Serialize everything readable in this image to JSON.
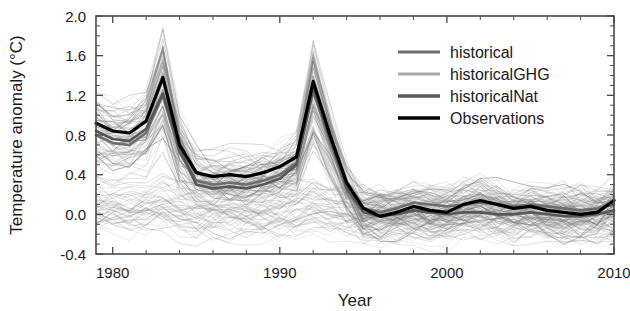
{
  "chart_data": {
    "type": "line",
    "title": "",
    "xlabel": "Year",
    "ylabel": "Temperature anomaly (°C)",
    "xlim": [
      1979,
      2010
    ],
    "ylim": [
      -0.4,
      2.0
    ],
    "xticks": [
      1980,
      1990,
      2000,
      2010
    ],
    "xtick_labels": [
      "1980",
      "1990",
      "2000",
      "2010"
    ],
    "xtick_minor_step": 2,
    "yticks": [
      -0.4,
      0.0,
      0.4,
      0.8,
      1.2,
      1.6,
      2.0
    ],
    "ytick_labels": [
      "-0.4",
      "0.0",
      "0.4",
      "0.8",
      "1.2",
      "1.6",
      "2.0"
    ],
    "ytick_minor_step": 0.1,
    "grid": false,
    "ticks_direction": "in",
    "legend_position": "upper right",
    "x": [
      1979,
      1980,
      1981,
      1982,
      1983,
      1984,
      1985,
      1986,
      1987,
      1988,
      1989,
      1990,
      1991,
      1992,
      1993,
      1994,
      1995,
      1996,
      1997,
      1998,
      1999,
      2000,
      2001,
      2002,
      2003,
      2004,
      2005,
      2006,
      2007,
      2008,
      2009,
      2010
    ],
    "series": [
      {
        "name": "historical",
        "color": "#6e6e6e",
        "linewidth": 2.6,
        "role": "ensemble-mean",
        "values": [
          0.8,
          0.72,
          0.7,
          0.82,
          1.2,
          0.62,
          0.34,
          0.3,
          0.32,
          0.3,
          0.34,
          0.4,
          0.52,
          1.24,
          0.74,
          0.28,
          0.06,
          0.02,
          0.06,
          0.12,
          0.1,
          0.08,
          0.1,
          0.12,
          0.1,
          0.08,
          0.1,
          0.08,
          0.06,
          0.04,
          0.06,
          0.1
        ]
      },
      {
        "name": "historicalGHG",
        "color": "#a8a8a8",
        "linewidth": 2.4,
        "role": "ensemble-mean",
        "values": [
          0.1,
          0.08,
          0.1,
          0.08,
          0.12,
          0.1,
          0.08,
          0.06,
          0.1,
          0.08,
          0.06,
          0.08,
          0.1,
          0.06,
          0.04,
          0.02,
          0.04,
          0.02,
          0.04,
          0.06,
          0.04,
          0.06,
          0.04,
          0.06,
          0.04,
          0.06,
          0.04,
          0.02,
          0.04,
          0.02,
          0.04,
          0.06
        ]
      },
      {
        "name": "historicalNat",
        "color": "#575757",
        "linewidth": 2.6,
        "role": "ensemble-mean",
        "values": [
          0.84,
          0.76,
          0.74,
          0.86,
          1.22,
          0.66,
          0.3,
          0.26,
          0.28,
          0.26,
          0.3,
          0.36,
          0.5,
          1.28,
          0.76,
          0.26,
          0.02,
          -0.02,
          0.0,
          0.04,
          0.02,
          0.0,
          0.02,
          0.02,
          0.0,
          0.0,
          0.02,
          0.0,
          -0.02,
          -0.02,
          0.0,
          0.04
        ]
      },
      {
        "name": "Observations",
        "color": "#000000",
        "linewidth": 3.2,
        "role": "observations",
        "values": [
          0.92,
          0.84,
          0.82,
          0.94,
          1.38,
          0.7,
          0.42,
          0.38,
          0.4,
          0.38,
          0.42,
          0.48,
          0.58,
          1.34,
          0.8,
          0.32,
          0.06,
          -0.02,
          0.02,
          0.08,
          0.04,
          0.02,
          0.1,
          0.14,
          0.1,
          0.06,
          0.08,
          0.04,
          0.02,
          0.0,
          0.02,
          0.14
        ]
      }
    ],
    "ensemble_spread": {
      "description": "Many thin gray individual model-run lines (spaghetti) underlying the thick mean lines",
      "band_color": "#808080",
      "upper_envelope_1992": 1.85,
      "lower_envelope_1992": 0.35,
      "baseline_band": [
        -0.25,
        0.35
      ]
    },
    "legend": [
      {
        "label": "historical",
        "color": "#6e6e6e",
        "linewidth": 3.0
      },
      {
        "label": "historicalGHG",
        "color": "#a8a8a8",
        "linewidth": 3.0
      },
      {
        "label": "historicalNat",
        "color": "#575757",
        "linewidth": 3.4
      },
      {
        "label": "Observations",
        "color": "#000000",
        "linewidth": 3.6
      }
    ]
  }
}
